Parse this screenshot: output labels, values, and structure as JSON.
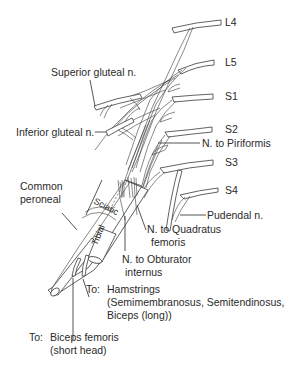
{
  "diagram": {
    "type": "anatomical-nerve-diagram",
    "roots": [
      {
        "id": "L4",
        "label": "L4"
      },
      {
        "id": "L5",
        "label": "L5"
      },
      {
        "id": "S1",
        "label": "S1"
      },
      {
        "id": "S2",
        "label": "S2"
      },
      {
        "id": "S3",
        "label": "S3"
      },
      {
        "id": "S4",
        "label": "S4"
      }
    ],
    "labels": {
      "superior_gluteal": "Superior gluteal n.",
      "inferior_gluteal": "Inferior gluteal n.",
      "piriformis": "N. to Piriformis",
      "common_peroneal_1": "Common",
      "common_peroneal_2": "peroneal",
      "sciatic": "Sciatic",
      "tibial": "Tibial",
      "pudendal": "Pudendal n.",
      "quadratus_1": "N. to Quadratus",
      "quadratus_2": "femoris",
      "obturator_1": "N. to Obturator",
      "obturator_2": "internus",
      "hamstrings_to": "To:",
      "hamstrings_1": "Hamstrings",
      "hamstrings_2": "(Semimembranosus, Semitendinosus,",
      "hamstrings_3": "Biceps (long))",
      "biceps_to": "To:",
      "biceps_1": "Biceps femoris",
      "biceps_2": "(short head)"
    },
    "colors": {
      "line": "#3a3a3a",
      "text": "#2a2a2a",
      "background": "#ffffff"
    }
  }
}
